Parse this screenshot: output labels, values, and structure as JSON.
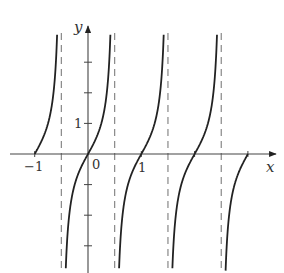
{
  "chart_data": {
    "type": "line",
    "title": "",
    "function": "y = tan(pi x)",
    "xlabel": "x",
    "ylabel": "y",
    "x_tick_labels": [
      "-1",
      "0",
      "1"
    ],
    "y_tick_labels": [
      "1"
    ],
    "x_ticks": [
      -1,
      0,
      1,
      2,
      3
    ],
    "y_ticks": [
      -3,
      -2,
      -1,
      1,
      2,
      3
    ],
    "vertical_asymptotes": [
      -0.5,
      0.5,
      1.5,
      2.5
    ],
    "xlim": [
      -1.5,
      3.5
    ],
    "ylim": [
      -3.9,
      4.0
    ],
    "grid": false,
    "legend": null,
    "series": [
      {
        "name": "branch-1",
        "x_range": [
          -1.0,
          -0.5
        ],
        "points": [
          [
            -1.0,
            0
          ],
          [
            -0.75,
            1
          ],
          [
            -0.6,
            3.08
          ]
        ]
      },
      {
        "name": "branch-2",
        "x_range": [
          -0.5,
          0.5
        ],
        "points": [
          [
            -0.4,
            -3.08
          ],
          [
            -0.25,
            -1
          ],
          [
            0,
            0
          ],
          [
            0.25,
            1
          ],
          [
            0.4,
            3.08
          ]
        ]
      },
      {
        "name": "branch-3",
        "x_range": [
          0.5,
          1.5
        ],
        "points": [
          [
            0.6,
            -3.08
          ],
          [
            0.75,
            -1
          ],
          [
            1,
            0
          ],
          [
            1.25,
            1
          ],
          [
            1.4,
            3.08
          ]
        ]
      },
      {
        "name": "branch-4",
        "x_range": [
          1.5,
          2.5
        ],
        "points": [
          [
            1.6,
            -3.08
          ],
          [
            1.75,
            -1
          ],
          [
            2,
            0
          ],
          [
            2.25,
            1
          ],
          [
            2.4,
            3.08
          ]
        ]
      },
      {
        "name": "branch-5",
        "x_range": [
          2.5,
          3.0
        ],
        "points": [
          [
            2.6,
            -3.08
          ],
          [
            2.75,
            -1
          ],
          [
            3.0,
            0
          ]
        ]
      }
    ],
    "colors": {
      "curve": "#222222",
      "axis": "#444444",
      "asymptote": "#888888"
    }
  },
  "labels": {
    "x_axis": "x",
    "y_axis": "y",
    "tick_neg1": "−1",
    "tick_0": "0",
    "tick_1": "1",
    "ytick_1": "1"
  }
}
